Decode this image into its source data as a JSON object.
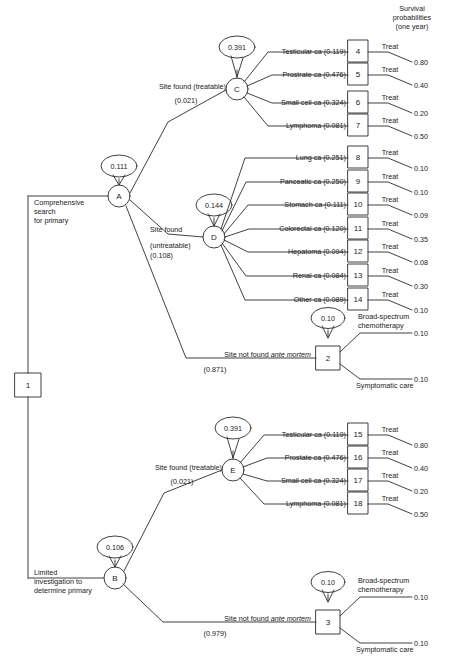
{
  "diagram": {
    "type": "decision-tree",
    "title": "",
    "header": {
      "line1": "Survival",
      "line2": "probabilities",
      "line3": "(one year)"
    },
    "root": {
      "id": "1",
      "shape": "square"
    },
    "strategies": [
      {
        "id": "A",
        "label_lines": [
          "Comprehensive",
          "search",
          "for primary"
        ],
        "value": "0.111",
        "node_shape": "circle"
      },
      {
        "id": "B",
        "label_lines": [
          "Limited",
          "investigation to",
          "determine primary"
        ],
        "value": "0.106",
        "node_shape": "circle"
      }
    ],
    "chance_nodes": [
      {
        "id": "C",
        "value": "0.391"
      },
      {
        "id": "D",
        "value": "0.144"
      },
      {
        "id": "E",
        "value": "0.391"
      },
      {
        "id": "2",
        "value": "0.10"
      },
      {
        "id": "3",
        "value": "0.10"
      }
    ],
    "branch_labels": {
      "site_found_treatable": "Site found (treatable)",
      "site_found_treatable_prob": "(0.021)",
      "site_found_line1": "Site found",
      "site_found_line2": "(untreatable)",
      "site_found_prob": "(0.108)",
      "site_not_found_prefix": "Site not found ",
      "site_not_found_italic": "ante mortem",
      "site_not_found_prob_a": "(0.871)",
      "site_not_found_prob_b": "(0.979)",
      "broad_spectrum_line1": "Broad-spectrum",
      "broad_spectrum_line2": "chemotherapy",
      "symptomatic_care": "Symptomatic care",
      "treat": "Treat"
    },
    "branches_C": [
      {
        "label": "Testicular ca (0.119)",
        "node": "4",
        "action": "Treat",
        "survival": "0.80"
      },
      {
        "label": "Prostrate ca (0.476)",
        "node": "5",
        "action": "Treat",
        "survival": "0.40"
      },
      {
        "label": "Small cell ca (0.324)",
        "node": "6",
        "action": "Treat",
        "survival": "0.20"
      },
      {
        "label": "Lymphoma (0.081)",
        "node": "7",
        "action": "Treat",
        "survival": "0.50"
      }
    ],
    "branches_D": [
      {
        "label": "Lung ca (0.251)",
        "node": "8",
        "action": "Treat",
        "survival": "0.10"
      },
      {
        "label": "Panceatic ca (0.250)",
        "node": "9",
        "action": "Treat",
        "survival": "0.10"
      },
      {
        "label": "Stomach ca (0.111)",
        "node": "10",
        "action": "Treat",
        "survival": "0.09"
      },
      {
        "label": "Colorectal ca (0.120)",
        "node": "11",
        "action": "Treat",
        "survival": "0.35"
      },
      {
        "label": "Hepatoma (0.094)",
        "node": "12",
        "action": "Treat",
        "survival": "0.08"
      },
      {
        "label": "Renal ca (0.084)",
        "node": "13",
        "action": "Treat",
        "survival": "0.30"
      },
      {
        "label": "Other ca (0.089)",
        "node": "14",
        "action": "Treat",
        "survival": "0.10"
      }
    ],
    "branches_E": [
      {
        "label": "Testicular ca (0.119)",
        "node": "15",
        "action": "Treat",
        "survival": "0.80"
      },
      {
        "label": "Prostate ca (0.476)",
        "node": "16",
        "action": "Treat",
        "survival": "0.40"
      },
      {
        "label": "Small cell ca (0.324)",
        "node": "17",
        "action": "Treat",
        "survival": "0.20"
      },
      {
        "label": "Lymphoma (0.081)",
        "node": "18",
        "action": "Treat",
        "survival": "0.50"
      }
    ],
    "branches_node2": [
      {
        "label_line1": "Broad-spectrum",
        "label_line2": "chemotherapy",
        "survival": "0.10"
      },
      {
        "label_line1": "Symptomatic care",
        "label_line2": "",
        "survival": "0.10"
      }
    ],
    "branches_node3": [
      {
        "label_line1": "Broad-spectrum",
        "label_line2": "chemotherapy",
        "survival": "0.10"
      },
      {
        "label_line1": "Symptomatic care",
        "label_line2": "",
        "survival": "0.10"
      }
    ],
    "colors": {
      "line": "#2b2b2b",
      "text": "#111111",
      "background": "#ffffff"
    }
  }
}
